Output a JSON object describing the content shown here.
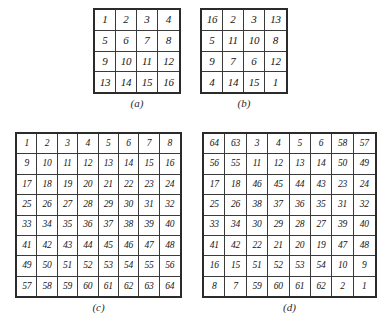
{
  "figure": {
    "background_color": "#ffffff",
    "ink_color": "#1a1a1a",
    "panels": [
      {
        "id": "a",
        "caption": "(a)",
        "rows": 4,
        "cols": 4,
        "cells": [
          1,
          2,
          3,
          4,
          5,
          6,
          7,
          8,
          9,
          10,
          11,
          12,
          13,
          14,
          15,
          16
        ]
      },
      {
        "id": "b",
        "caption": "(b)",
        "rows": 4,
        "cols": 4,
        "cells": [
          16,
          2,
          3,
          13,
          5,
          11,
          10,
          8,
          9,
          7,
          6,
          12,
          4,
          14,
          15,
          1
        ]
      },
      {
        "id": "c",
        "caption": "(c)",
        "rows": 8,
        "cols": 8,
        "cells": [
          1,
          2,
          3,
          4,
          5,
          6,
          7,
          8,
          9,
          10,
          11,
          12,
          13,
          14,
          15,
          16,
          17,
          18,
          19,
          20,
          21,
          22,
          23,
          24,
          25,
          26,
          27,
          28,
          29,
          30,
          31,
          32,
          33,
          34,
          35,
          36,
          37,
          38,
          39,
          40,
          41,
          42,
          43,
          44,
          45,
          46,
          47,
          48,
          49,
          50,
          51,
          52,
          53,
          54,
          55,
          56,
          57,
          58,
          59,
          60,
          61,
          62,
          63,
          64
        ]
      },
      {
        "id": "d",
        "caption": "(d)",
        "rows": 8,
        "cols": 8,
        "cells": [
          64,
          63,
          3,
          4,
          5,
          6,
          58,
          57,
          56,
          55,
          11,
          12,
          13,
          14,
          50,
          49,
          17,
          18,
          46,
          45,
          44,
          43,
          23,
          24,
          25,
          26,
          38,
          37,
          36,
          35,
          31,
          32,
          33,
          34,
          30,
          29,
          28,
          27,
          39,
          40,
          41,
          42,
          22,
          21,
          20,
          19,
          47,
          48,
          16,
          15,
          51,
          52,
          53,
          54,
          10,
          9,
          8,
          7,
          59,
          60,
          61,
          62,
          2,
          1
        ]
      }
    ]
  }
}
